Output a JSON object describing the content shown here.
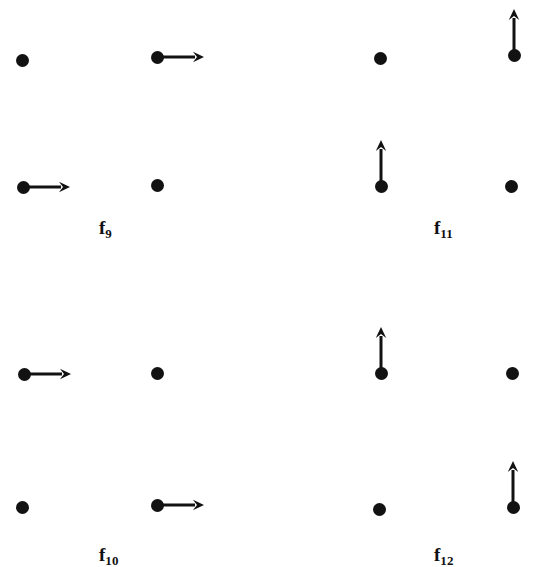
{
  "figure": {
    "width": 537,
    "height": 567,
    "background_color": "#ffffff",
    "ink_color": "#121212",
    "atom_radius_px": 6.5,
    "arrow_stroke_px": 3
  },
  "chart_data": {
    "type": "scatter",
    "xlabel": "",
    "ylabel": "",
    "xlim": [
      0,
      537
    ],
    "ylim": [
      567,
      0
    ],
    "grid": false,
    "legend": "none",
    "panels": [
      {
        "label": "f9",
        "label_text": "f",
        "label_sub": "9",
        "label_x": 99,
        "label_y": 218,
        "atoms": [
          {
            "id": "f9-top-left",
            "x": 22,
            "y": 60,
            "arrow": "none"
          },
          {
            "id": "f9-top-right",
            "x": 157,
            "y": 57,
            "arrow": "right",
            "arrow_length": 47
          },
          {
            "id": "f9-bottom-left",
            "x": 23,
            "y": 187,
            "arrow": "right",
            "arrow_length": 47
          },
          {
            "id": "f9-bottom-right",
            "x": 157,
            "y": 185,
            "arrow": "none"
          }
        ]
      },
      {
        "label": "f11",
        "label_text": "f",
        "label_sub": "11",
        "label_x": 434,
        "label_y": 218,
        "atoms": [
          {
            "id": "f11-top-left",
            "x": 380,
            "y": 58,
            "arrow": "none"
          },
          {
            "id": "f11-top-right",
            "x": 514,
            "y": 55,
            "arrow": "up",
            "arrow_length": 46
          },
          {
            "id": "f11-bottom-left",
            "x": 381,
            "y": 186,
            "arrow": "up",
            "arrow_length": 46
          },
          {
            "id": "f11-bottom-right",
            "x": 511,
            "y": 186,
            "arrow": "none"
          }
        ]
      },
      {
        "label": "f10",
        "label_text": "f",
        "label_sub": "10",
        "label_x": 99,
        "label_y": 545,
        "atoms": [
          {
            "id": "f10-top-left",
            "x": 24,
            "y": 374,
            "arrow": "right",
            "arrow_length": 47
          },
          {
            "id": "f10-top-right",
            "x": 157,
            "y": 373,
            "arrow": "none"
          },
          {
            "id": "f10-bottom-left",
            "x": 22,
            "y": 507,
            "arrow": "none"
          },
          {
            "id": "f10-bottom-right",
            "x": 157,
            "y": 505,
            "arrow": "right",
            "arrow_length": 47
          }
        ]
      },
      {
        "label": "f12",
        "label_text": "f",
        "label_sub": "12",
        "label_x": 434,
        "label_y": 545,
        "atoms": [
          {
            "id": "f12-top-left",
            "x": 381,
            "y": 373,
            "arrow": "up",
            "arrow_length": 46
          },
          {
            "id": "f12-top-right",
            "x": 512,
            "y": 373,
            "arrow": "none"
          },
          {
            "id": "f12-bottom-left",
            "x": 379,
            "y": 509,
            "arrow": "none"
          },
          {
            "id": "f12-bottom-right",
            "x": 513,
            "y": 507,
            "arrow": "up",
            "arrow_length": 46
          }
        ]
      }
    ]
  }
}
